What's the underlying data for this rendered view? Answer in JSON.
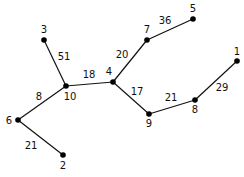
{
  "diagram": {
    "type": "weighted-tree",
    "nodes": [
      {
        "id": "1",
        "label": "1",
        "x": 237,
        "y": 61,
        "lx": 237,
        "ly": 55
      },
      {
        "id": "2",
        "label": "2",
        "x": 63,
        "y": 155,
        "lx": 63,
        "ly": 169
      },
      {
        "id": "3",
        "label": "3",
        "x": 44,
        "y": 40,
        "lx": 44,
        "ly": 33
      },
      {
        "id": "4",
        "label": "4",
        "x": 113,
        "y": 82,
        "lx": 109,
        "ly": 75
      },
      {
        "id": "5",
        "label": "5",
        "x": 193,
        "y": 19,
        "lx": 193,
        "ly": 12
      },
      {
        "id": "6",
        "label": "6",
        "x": 18,
        "y": 120,
        "lx": 9,
        "ly": 124
      },
      {
        "id": "7",
        "label": "7",
        "x": 147,
        "y": 40,
        "lx": 147,
        "ly": 33
      },
      {
        "id": "8",
        "label": "8",
        "x": 195,
        "y": 100,
        "lx": 195,
        "ly": 113
      },
      {
        "id": "9",
        "label": "9",
        "x": 149,
        "y": 114,
        "lx": 149,
        "ly": 127
      },
      {
        "id": "10",
        "label": "10",
        "x": 66,
        "y": 86,
        "lx": 70,
        "ly": 100
      }
    ],
    "edges": [
      {
        "from": "3",
        "to": "10",
        "weight": "51",
        "wx": 64,
        "wy": 60
      },
      {
        "from": "10",
        "to": "4",
        "weight": "18",
        "wx": 89,
        "wy": 78
      },
      {
        "from": "10",
        "to": "6",
        "weight": "8",
        "wx": 39,
        "wy": 100
      },
      {
        "from": "6",
        "to": "2",
        "weight": "21",
        "wx": 31,
        "wy": 149
      },
      {
        "from": "4",
        "to": "7",
        "weight": "20",
        "wx": 122,
        "wy": 58
      },
      {
        "from": "7",
        "to": "5",
        "weight": "36",
        "wx": 165,
        "wy": 24
      },
      {
        "from": "4",
        "to": "9",
        "weight": "17",
        "wx": 137,
        "wy": 95
      },
      {
        "from": "9",
        "to": "8",
        "weight": "21",
        "wx": 171,
        "wy": 101
      },
      {
        "from": "8",
        "to": "1",
        "weight": "29",
        "wx": 222,
        "wy": 91
      }
    ]
  }
}
